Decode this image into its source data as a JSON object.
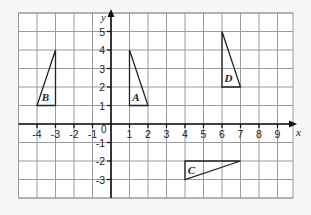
{
  "diagram": {
    "type": "coordinate_grid",
    "axes": {
      "x_label": "x",
      "y_label": "y",
      "origin_label": "0",
      "x_ticks": [
        "-4",
        "-3",
        "-2",
        "-1",
        "1",
        "2",
        "3",
        "4",
        "5",
        "6",
        "7",
        "8",
        "9"
      ],
      "x_tick_values": [
        -4,
        -3,
        -2,
        -1,
        1,
        2,
        3,
        4,
        5,
        6,
        7,
        8,
        9
      ],
      "y_ticks": [
        "5",
        "4",
        "3",
        "2",
        "1",
        "-1",
        "-2",
        "-3"
      ],
      "y_tick_values": [
        5,
        4,
        3,
        2,
        1,
        -1,
        -2,
        -3
      ],
      "x_range": [
        -5,
        10
      ],
      "y_range": [
        -4,
        6
      ]
    },
    "shapes": [
      {
        "label": "A",
        "vertices": [
          [
            1,
            4
          ],
          [
            1,
            1
          ],
          [
            2,
            1
          ]
        ]
      },
      {
        "label": "B",
        "vertices": [
          [
            -3,
            4
          ],
          [
            -3,
            1
          ],
          [
            -4,
            1
          ]
        ]
      },
      {
        "label": "C",
        "vertices": [
          [
            4,
            -2
          ],
          [
            4,
            -3
          ],
          [
            7,
            -2
          ]
        ]
      },
      {
        "label": "D",
        "vertices": [
          [
            6,
            5
          ],
          [
            6,
            2
          ],
          [
            7,
            2
          ]
        ]
      }
    ],
    "colors": {
      "grid": "#9a9a9a",
      "axis": "#111111",
      "shape": "#222222",
      "background": "#ffffff"
    }
  }
}
